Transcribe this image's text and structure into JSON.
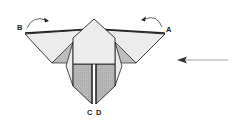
{
  "diagram": {
    "type": "origami-step",
    "labels": {
      "a": "A",
      "b": "B",
      "c": "C",
      "d": "D"
    },
    "arrows": {
      "fold_b": "curved arrow from B toward center",
      "fold_a": "curved arrow from A toward center",
      "direction": "straight arrow pointing left"
    },
    "colors": {
      "paper_light": "#ececec",
      "paper_shade": "#b8b8b8",
      "stroke": "#222222",
      "arrow_line": "#9a9a9a"
    }
  }
}
